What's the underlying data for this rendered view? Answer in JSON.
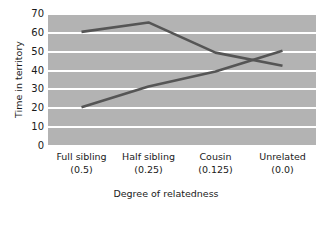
{
  "chart_data": {
    "type": "line",
    "title": "",
    "xlabel": "Degree of relatedness",
    "ylabel": "Time in territory",
    "categories": [
      "Full sibling",
      "Half sibling",
      "Cousin",
      "Unrelated"
    ],
    "category_values": [
      "(0.5)",
      "(0.25)",
      "(0.125)",
      "(0.0)"
    ],
    "ylim": [
      0,
      70
    ],
    "yticks": [
      70,
      60,
      50,
      40,
      30,
      20,
      10,
      0
    ],
    "grid": true,
    "legend": "none",
    "plot_background": "#b3b3b3",
    "gridline_color": "#ffffff",
    "line_color": "#555555",
    "series": [
      {
        "name": "series-1",
        "values": [
          60,
          65,
          49,
          42
        ],
        "color": "#555555"
      },
      {
        "name": "series-2",
        "values": [
          20,
          31,
          39,
          50
        ],
        "color": "#555555"
      }
    ]
  }
}
